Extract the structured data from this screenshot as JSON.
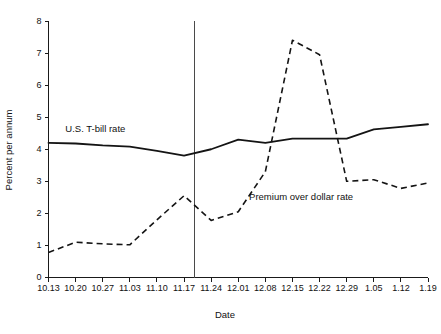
{
  "chart_data": {
    "type": "line",
    "title": "",
    "xlabel": "Date",
    "ylabel": "Percent per annum",
    "ylim": [
      0,
      8
    ],
    "yticks": [
      0,
      1,
      2,
      3,
      4,
      5,
      6,
      7,
      8
    ],
    "grid": false,
    "legend_position": "inline-annotation",
    "categories": [
      "10.13",
      "10.20",
      "10.27",
      "11.03",
      "11.10",
      "11.17",
      "11.24",
      "12.01",
      "12.08",
      "12.15",
      "12.22",
      "12.29",
      "1.05",
      "1.12",
      "1.19"
    ],
    "series": [
      {
        "name": "U.S. T-bill rate",
        "style": "solid",
        "values": [
          4.2,
          4.18,
          4.12,
          4.08,
          3.95,
          3.8,
          4.0,
          4.3,
          4.2,
          4.33,
          4.33,
          4.33,
          4.62,
          4.7,
          4.78
        ]
      },
      {
        "name": "Premium over dollar rate",
        "style": "dashed",
        "values": [
          0.78,
          1.1,
          1.05,
          1.02,
          1.8,
          2.55,
          1.78,
          2.05,
          3.3,
          7.4,
          6.95,
          3.0,
          3.05,
          2.78,
          2.95
        ]
      }
    ],
    "annotations": [
      {
        "name": "t-bill-label",
        "text": "U.S. T-bill rate",
        "x": 0.62,
        "y": 4.55
      },
      {
        "name": "premium-label",
        "text": "Premium over dollar rate",
        "x": 7.4,
        "y": 2.42
      }
    ],
    "reference_line": {
      "name": "event-marker",
      "x_fraction": 5.4,
      "y_top": 8.0,
      "y_bottom": 0.0
    }
  },
  "axis": {
    "y_label": "Percent per annum",
    "x_label": "Date",
    "y_tick_labels": [
      "0",
      "1",
      "2",
      "3",
      "4",
      "5",
      "6",
      "7",
      "8"
    ],
    "x_tick_labels": [
      "10.13",
      "10.20",
      "10.27",
      "11.03",
      "11.10",
      "11.17",
      "11.24",
      "12.01",
      "12.08",
      "12.15",
      "12.22",
      "12.29",
      "1.05",
      "1.12",
      "1.19"
    ]
  },
  "labels": {
    "series_solid": "U.S. T-bill rate",
    "series_dashed": "Premium over dollar rate"
  },
  "colors": {
    "background": "#ffffff",
    "ink": "#141414",
    "axis": "#1a1a1a",
    "reference_line": "#4a4a4a"
  }
}
